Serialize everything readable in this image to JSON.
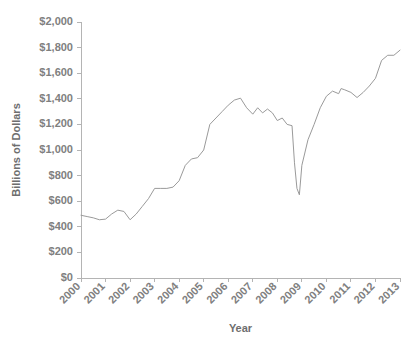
{
  "chart_data": {
    "type": "line",
    "title": "",
    "xlabel": "Year",
    "ylabel": "Billions of Dollars",
    "xlim": [
      2000,
      2013
    ],
    "ylim": [
      0,
      2000
    ],
    "grid": false,
    "legend": null,
    "line_color": "#9a9a9a",
    "axis_color": "#b4b4b4",
    "label_color": "#808080",
    "y_ticks": [
      0,
      200,
      400,
      600,
      800,
      1000,
      1200,
      1400,
      1600,
      1800,
      2000
    ],
    "y_tick_labels": [
      "$0",
      "$200",
      "$400",
      "$600",
      "$800",
      "$1,000",
      "$1,200",
      "$1,400",
      "$1,600",
      "$1,800",
      "$2,000"
    ],
    "x_ticks": [
      2000,
      2001,
      2002,
      2003,
      2004,
      2005,
      2006,
      2007,
      2008,
      2009,
      2010,
      2011,
      2012,
      2013
    ],
    "x_tick_labels": [
      "2000",
      "2001",
      "2002",
      "2003",
      "2004",
      "2005",
      "2006",
      "2007",
      "2008",
      "2009",
      "2010",
      "2011",
      "2012",
      "2013"
    ],
    "x": [
      2000.0,
      2000.25,
      2000.5,
      2000.75,
      2001.0,
      2001.25,
      2001.5,
      2001.75,
      2002.0,
      2002.25,
      2002.5,
      2002.75,
      2003.0,
      2003.25,
      2003.5,
      2003.75,
      2004.0,
      2004.25,
      2004.5,
      2004.75,
      2005.0,
      2005.25,
      2005.5,
      2005.75,
      2006.0,
      2006.25,
      2006.5,
      2006.75,
      2007.0,
      2007.2,
      2007.4,
      2007.6,
      2007.8,
      2008.0,
      2008.2,
      2008.4,
      2008.6,
      2008.7,
      2008.8,
      2008.9,
      2009.0,
      2009.25,
      2009.5,
      2009.75,
      2010.0,
      2010.25,
      2010.5,
      2010.6,
      2010.75,
      2011.0,
      2011.25,
      2011.5,
      2011.75,
      2012.0,
      2012.25,
      2012.5,
      2012.75,
      2013.0
    ],
    "values": [
      490,
      480,
      470,
      455,
      460,
      500,
      530,
      520,
      455,
      500,
      560,
      620,
      700,
      700,
      700,
      710,
      760,
      880,
      930,
      940,
      1000,
      1200,
      1250,
      1300,
      1350,
      1390,
      1405,
      1330,
      1280,
      1330,
      1290,
      1320,
      1290,
      1230,
      1250,
      1200,
      1190,
      900,
      700,
      650,
      880,
      1080,
      1200,
      1330,
      1420,
      1460,
      1440,
      1480,
      1470,
      1450,
      1410,
      1450,
      1500,
      1560,
      1700,
      1740,
      1740,
      1780
    ],
    "annotations": []
  }
}
